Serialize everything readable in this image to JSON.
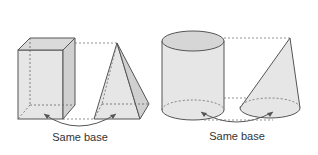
{
  "figures": [
    {
      "name": "prism-and-pyramid",
      "solids": [
        "rectangular prism",
        "pyramid"
      ],
      "caption": "Same base"
    },
    {
      "name": "cylinder-and-cone",
      "solids": [
        "cylinder",
        "cone"
      ],
      "caption": "Same base"
    }
  ],
  "colors": {
    "fill": "#e4e4e4",
    "fill_dark": "#cfcfcf",
    "stroke": "#555555",
    "dash": "#777777"
  }
}
